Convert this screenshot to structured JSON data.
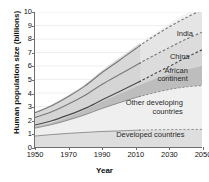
{
  "chart_data": {
    "type": "area",
    "title": "",
    "xlabel": "Year",
    "ylabel": "Human population size (billions)",
    "xlim": [
      1950,
      2050
    ],
    "ylim": [
      0,
      10
    ],
    "grid": true,
    "grid_axis": "y",
    "legend_position": "inline-annotations",
    "x_ticks": [
      "1950",
      "1970",
      "1990",
      "2010",
      "2030",
      "2050"
    ],
    "x_tick_values": [
      1950,
      1970,
      1990,
      2010,
      2030,
      2050
    ],
    "y_ticks": [
      "0",
      "1",
      "2",
      "3",
      "4",
      "5",
      "6",
      "7",
      "8",
      "9",
      "10"
    ],
    "y_tick_values": [
      0,
      1,
      2,
      3,
      4,
      5,
      6,
      7,
      8,
      9,
      10
    ],
    "historic_projection_split_year": 2013,
    "note": "Cumulative stacked bands; upper edge of each band is the running total. Dashed segments after 2013 are projections; grey envelope around the totals is the projection uncertainty range.",
    "x": [
      1950,
      1960,
      1970,
      1980,
      1990,
      2000,
      2010,
      2013,
      2020,
      2030,
      2040,
      2050
    ],
    "series": [
      {
        "name": "Developed countries",
        "label": "Developed countries",
        "cumulative": [
          0.81,
          0.92,
          1.01,
          1.08,
          1.15,
          1.19,
          1.24,
          1.25,
          1.27,
          1.29,
          1.3,
          1.3
        ],
        "values": [
          0.81,
          0.92,
          1.01,
          1.08,
          1.15,
          1.19,
          1.24,
          1.25,
          1.27,
          1.29,
          1.3,
          1.3
        ],
        "color": "#dedede"
      },
      {
        "name": "Other developing countries",
        "label": "Other developing countries",
        "cumulative": [
          1.4,
          1.66,
          2.0,
          2.39,
          2.85,
          3.26,
          3.65,
          3.75,
          3.97,
          4.25,
          4.44,
          4.55
        ],
        "values": [
          0.59,
          0.74,
          0.99,
          1.31,
          1.7,
          2.07,
          2.41,
          2.5,
          2.7,
          2.96,
          3.14,
          3.25
        ],
        "color": "#efefef"
      },
      {
        "name": "African continent",
        "label": "African continent",
        "cumulative": [
          1.63,
          1.94,
          2.37,
          2.86,
          3.48,
          4.07,
          4.68,
          4.87,
          5.32,
          5.95,
          6.6,
          7.2
        ],
        "values": [
          0.23,
          0.28,
          0.37,
          0.47,
          0.63,
          0.81,
          1.03,
          1.12,
          1.35,
          1.7,
          2.16,
          2.65
        ],
        "color": "#bdbdbd"
      },
      {
        "name": "China",
        "label": "China",
        "cumulative": [
          2.18,
          2.61,
          3.19,
          3.84,
          4.63,
          5.33,
          6.02,
          6.23,
          6.7,
          7.34,
          7.96,
          8.5
        ],
        "values": [
          0.55,
          0.67,
          0.82,
          0.98,
          1.15,
          1.26,
          1.34,
          1.36,
          1.38,
          1.39,
          1.36,
          1.3
        ],
        "color": "#cfcfcf"
      },
      {
        "name": "India",
        "label": "India",
        "cumulative": [
          2.54,
          3.06,
          3.74,
          4.53,
          5.5,
          6.37,
          7.26,
          7.53,
          8.11,
          8.87,
          9.55,
          10.15
        ],
        "values": [
          0.36,
          0.45,
          0.55,
          0.69,
          0.87,
          1.04,
          1.24,
          1.3,
          1.41,
          1.53,
          1.59,
          1.65
        ],
        "color": "#e3e3e3"
      }
    ],
    "uncertainty": {
      "total_low": [
        1.5,
        1.8,
        2.25,
        2.75,
        3.35,
        3.9,
        4.45,
        4.6,
        4.95,
        5.35,
        5.7,
        6.0
      ],
      "total_high": [
        2.6,
        3.15,
        3.85,
        4.65,
        5.65,
        6.55,
        7.45,
        7.7,
        8.3,
        9.1,
        9.85,
        10.4
      ]
    },
    "annotations": [
      {
        "text": "India",
        "x": 2044,
        "y": 8.4
      },
      {
        "text": "China",
        "x": 2042,
        "y": 6.7
      },
      {
        "text": "African\ncontinent",
        "x": 2041,
        "y": 5.4
      },
      {
        "text": "Other developing\ncountries",
        "x": 2038,
        "y": 3.0
      },
      {
        "text": "Developed countries",
        "x": 2039,
        "y": 0.95
      }
    ]
  },
  "axes": {
    "x_title": "Year",
    "y_title": "Human population size (billions)"
  },
  "colors": {
    "axis": "#6e6e6e",
    "grid": "#ececec",
    "text": "#111111",
    "line_dark": "#7a7a7a",
    "line_darkest": "#4a4a4a",
    "band_outer": "#e8e8e8",
    "band_inner": "#d3d3d3",
    "plot_background": "#ffffff"
  }
}
